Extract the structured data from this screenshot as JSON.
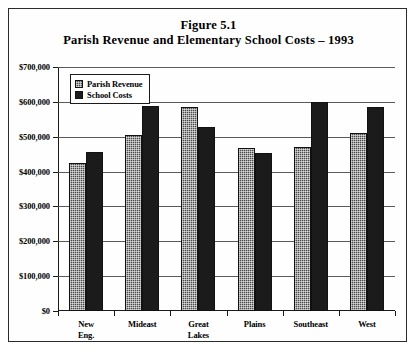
{
  "figure": {
    "title_line1": "Figure 5.1",
    "title_line2": "Parish Revenue and Elementary School Costs – 1993"
  },
  "legend": {
    "position": "top-left-inside-plot",
    "entries": [
      {
        "label": "Parish Revenue",
        "swatch": "hatched-gray",
        "color": "#4a4a4a"
      },
      {
        "label": "School Costs",
        "swatch": "solid-black",
        "color": "#1b1b1b"
      }
    ]
  },
  "axes": {
    "y_ticks": [
      "$0",
      "$100,000",
      "$200,000",
      "$300,000",
      "$400,000",
      "$500,000",
      "$600,000",
      "$700,000"
    ],
    "x_categories_display": [
      [
        "New",
        "Eng."
      ],
      [
        "Mideast"
      ],
      [
        "Great",
        "Lakes"
      ],
      [
        "Plains"
      ],
      [
        "Southeast"
      ],
      [
        "West"
      ]
    ]
  },
  "chart_data": {
    "type": "bar",
    "xlabel": "",
    "ylabel": "",
    "ylim": [
      0,
      700000
    ],
    "ytick_step": 100000,
    "grid": true,
    "legend_position": "upper left",
    "categories": [
      "New Eng.",
      "Mideast",
      "Great Lakes",
      "Plains",
      "Southeast",
      "West"
    ],
    "series": [
      {
        "name": "Parish Revenue",
        "values": [
          425000,
          505000,
          585000,
          467000,
          470000,
          512000
        ]
      },
      {
        "name": "School Costs",
        "values": [
          455000,
          587000,
          527000,
          452000,
          600000,
          585000
        ]
      }
    ]
  }
}
